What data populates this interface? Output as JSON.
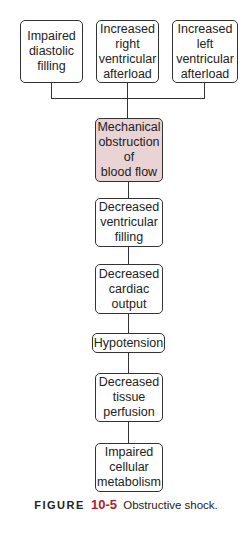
{
  "diagram": {
    "causes": [
      {
        "label": "Impaired\ndiastolic\nfilling"
      },
      {
        "label": "Increased\nright\nventricular\nafterload"
      },
      {
        "label": "Increased\nleft\nventricular\nafterload"
      }
    ],
    "chain": [
      {
        "label": "Mechanical\nobstruction\nof\nblood flow",
        "highlight": true
      },
      {
        "label": "Decreased\nventricular\nfilling"
      },
      {
        "label": "Decreased\ncardiac\noutput"
      },
      {
        "label": "Hypotension"
      },
      {
        "label": "Decreased\ntissue\nperfusion"
      },
      {
        "label": "Impaired\ncellular\nmetabolism"
      }
    ],
    "highlight_color": "#e9d3d5"
  },
  "caption": {
    "prefix": "FIGURE",
    "number": "10-5",
    "text": "Obstructive shock."
  }
}
